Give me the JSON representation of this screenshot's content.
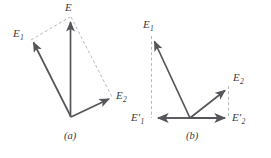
{
  "figure": {
    "background_color": "#ffffff",
    "solid_stroke_color": "#55555a",
    "dashed_stroke_color": "#b9b9bd",
    "label_color": "#3a3a3c",
    "panels": [
      {
        "id": "a",
        "caption": "(a)",
        "caption_x": 64,
        "caption_y": 131,
        "origin": {
          "x": 71,
          "y": 117
        },
        "vectors": [
          {
            "name": "E1",
            "label": "E",
            "subscript": "1",
            "prime": false,
            "tip_x": 31,
            "tip_y": 40,
            "label_x": 13,
            "label_y": 28,
            "style": "solid"
          },
          {
            "name": "E2",
            "label": "E",
            "subscript": "2",
            "prime": false,
            "tip_x": 112,
            "tip_y": 97,
            "label_x": 116,
            "label_y": 90,
            "style": "solid"
          },
          {
            "name": "E",
            "label": "E",
            "subscript": "",
            "prime": false,
            "tip_x": 70,
            "tip_y": 17,
            "label_x": 64,
            "label_y": 2,
            "style": "solid"
          }
        ],
        "construction_lines": [
          {
            "name": "dashed-e1-to-e",
            "x1": 31,
            "y1": 40,
            "x2": 70,
            "y2": 17
          },
          {
            "name": "dashed-e-to-e2",
            "x1": 71,
            "y1": 17,
            "x2": 112,
            "y2": 97
          }
        ]
      },
      {
        "id": "b",
        "caption": "(b)",
        "caption_x": 186,
        "caption_y": 131,
        "origin": {
          "x": 190,
          "y": 118
        },
        "vectors": [
          {
            "name": "E1",
            "label": "E",
            "subscript": "1",
            "prime": false,
            "tip_x": 152,
            "tip_y": 38,
            "label_x": 143,
            "label_y": 19,
            "style": "solid"
          },
          {
            "name": "E2",
            "label": "E",
            "subscript": "2",
            "prime": false,
            "tip_x": 228,
            "tip_y": 88,
            "label_x": 233,
            "label_y": 72,
            "style": "solid"
          },
          {
            "name": "E1-prime",
            "label": "E",
            "subscript": "1",
            "prime": true,
            "tip_x": 155,
            "tip_y": 118,
            "label_x": 131,
            "label_y": 112,
            "style": "solid"
          },
          {
            "name": "E2-prime",
            "label": "E",
            "subscript": "2",
            "prime": true,
            "tip_x": 228,
            "tip_y": 118,
            "label_x": 232,
            "label_y": 112,
            "style": "solid"
          }
        ],
        "construction_lines": [
          {
            "name": "dashed-e1-projection",
            "x1": 151,
            "y1": 36,
            "x2": 151,
            "y2": 118
          },
          {
            "name": "dashed-e2-projection",
            "x1": 229,
            "y1": 86,
            "x2": 229,
            "y2": 118
          }
        ]
      }
    ]
  }
}
